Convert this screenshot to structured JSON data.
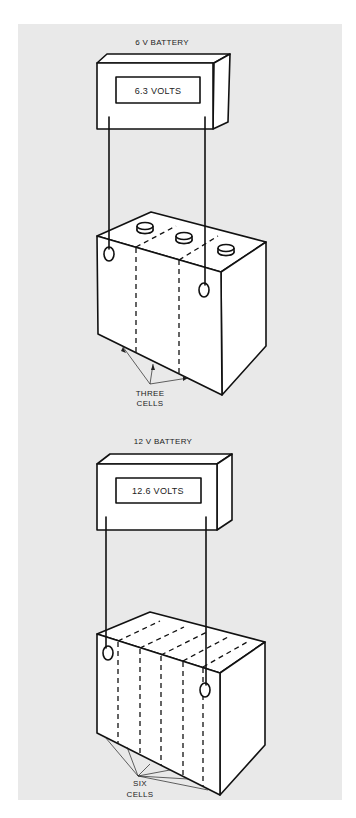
{
  "figure": {
    "background_color": "#e9e9e9",
    "line_color": "#111111",
    "diagrams": [
      {
        "title": "6 V BATTERY",
        "meter_reading": "6.3 VOLTS",
        "cells_label_line1": "THREE",
        "cells_label_line2": "CELLS",
        "cell_count": 3
      },
      {
        "title": "12 V BATTERY",
        "meter_reading": "12.6 VOLTS",
        "cells_label_line1": "SIX",
        "cells_label_line2": "CELLS",
        "cell_count": 6
      }
    ]
  }
}
